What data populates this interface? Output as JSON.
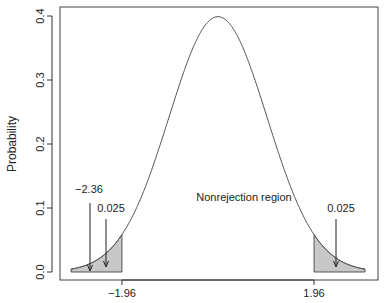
{
  "chart_data": {
    "type": "area",
    "title": "",
    "xlabel": "",
    "ylabel": "Probability",
    "xlim": [
      -3.2,
      3.3
    ],
    "ylim": [
      -0.015,
      0.415
    ],
    "x_ticks": [
      {
        "value": -1.96,
        "label": "−1.96"
      },
      {
        "value": 1.96,
        "label": "1.96"
      }
    ],
    "y_ticks": [
      {
        "value": 0.0,
        "label": "0.0"
      },
      {
        "value": 0.1,
        "label": "0.1"
      },
      {
        "value": 0.2,
        "label": "0.2"
      },
      {
        "value": 0.3,
        "label": "0.3"
      },
      {
        "value": 0.4,
        "label": "0.4"
      }
    ],
    "grid": false,
    "legend": null,
    "series": [
      {
        "name": "Standard normal density",
        "distribution": "normal",
        "mean": 0,
        "sd": 1,
        "x_range": [
          -3,
          3
        ],
        "peak": 0.399
      }
    ],
    "shaded_regions": [
      {
        "name": "left rejection region",
        "from": -3,
        "to": -1.96,
        "area": 0.025,
        "fill": "#c8c8c8"
      },
      {
        "name": "right rejection region",
        "from": 1.96,
        "to": 3,
        "area": 0.025,
        "fill": "#c8c8c8"
      }
    ],
    "annotations": [
      {
        "text": "−2.36",
        "points_to_x": -2.36,
        "points_to_y": 0.0
      },
      {
        "text": "0.025",
        "points_to_x": -2.2,
        "points_to_y": 0.0,
        "side": "left"
      },
      {
        "text": "0.025",
        "points_to_x": 2.2,
        "points_to_y": 0.0,
        "side": "right"
      },
      {
        "text": "Nonrejection region",
        "x": 0,
        "y": 0.1
      }
    ]
  },
  "labels": {
    "ylabel": "Probability",
    "annot_stat": "−2.36",
    "annot_left_area": "0.025",
    "annot_right_area": "0.025",
    "annot_middle": "Nonrejection region"
  },
  "colors": {
    "curve": "#555555",
    "shade": "#c8c8c8",
    "axis": "#333333",
    "text": "#222222"
  }
}
